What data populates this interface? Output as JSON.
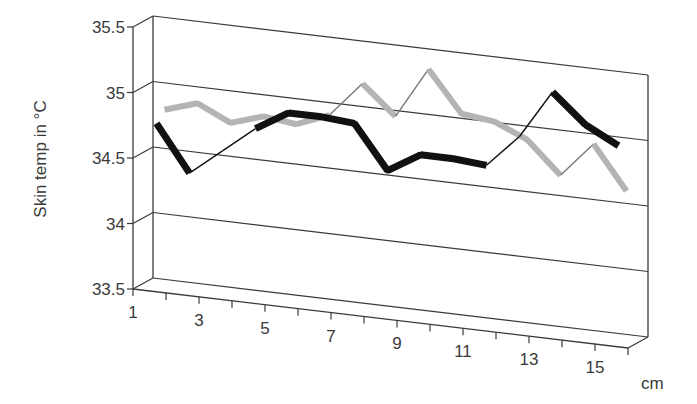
{
  "chart_data": {
    "type": "line",
    "variant": "3d-line",
    "title": "",
    "xlabel": "cm",
    "ylabel": "Skin temp in °C",
    "ylim": [
      33.5,
      35.5
    ],
    "y_ticks": [
      "35.5",
      "35",
      "34.5",
      "34",
      "33.5"
    ],
    "x": [
      1,
      2,
      3,
      4,
      5,
      6,
      7,
      8,
      9,
      10,
      11,
      12,
      13,
      14,
      15
    ],
    "x_tick_labels": [
      "1",
      "3",
      "5",
      "7",
      "9",
      "11",
      "13",
      "15"
    ],
    "grid": true,
    "legend": null,
    "series": [
      {
        "name": "Series 1 (black)",
        "color": "#111111",
        "values": [
          34.75,
          34.4,
          34.6,
          34.8,
          34.95,
          34.95,
          34.93,
          34.6,
          34.75,
          34.75,
          34.73,
          34.98,
          35.35,
          35.13,
          35.0
        ]
      },
      {
        "name": "Series 2 (grey)",
        "color": "#b4b4b4",
        "values": [
          34.82,
          34.9,
          34.78,
          34.86,
          34.83,
          34.93,
          35.2,
          34.98,
          35.37,
          35.06,
          35.03,
          34.92,
          34.68,
          34.95,
          34.62
        ]
      }
    ]
  }
}
